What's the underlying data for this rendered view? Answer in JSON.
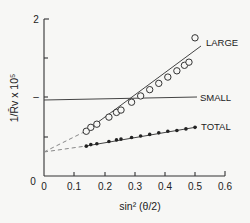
{
  "chart_data": {
    "type": "scatter",
    "title": "",
    "xlabel": "sin² (θ/2)",
    "ylabel": "1/R̄v x 10⁵",
    "xlim": [
      0,
      0.6
    ],
    "ylim": [
      0,
      2
    ],
    "x_ticks": [
      "0",
      "0.1",
      "0.2",
      "0.3",
      "0.4",
      "0.5",
      "0.6"
    ],
    "y_ticks": [
      "0",
      "1",
      "2"
    ],
    "grid": false,
    "series": [
      {
        "name": "LARGE",
        "marker": "open-circle",
        "x": [
          0.14,
          0.155,
          0.175,
          0.215,
          0.24,
          0.255,
          0.29,
          0.32,
          0.35,
          0.38,
          0.41,
          0.44,
          0.465,
          0.48,
          0.5
        ],
        "y": [
          0.57,
          0.62,
          0.66,
          0.75,
          0.81,
          0.84,
          0.94,
          1.02,
          1.1,
          1.18,
          1.26,
          1.34,
          1.41,
          1.45,
          1.76
        ],
        "fit": {
          "intercept": 0.3,
          "slope": 2.6,
          "extrapolated_dashed_to": 0
        }
      },
      {
        "name": "SMALL",
        "marker": "none",
        "x": [
          0,
          0.5
        ],
        "y": [
          0.96,
          0.96
        ]
      },
      {
        "name": "TOTAL",
        "marker": "filled-circle",
        "x": [
          0.14,
          0.155,
          0.175,
          0.215,
          0.24,
          0.255,
          0.29,
          0.32,
          0.35,
          0.38,
          0.41,
          0.44,
          0.47,
          0.5
        ],
        "y": [
          0.38,
          0.4,
          0.41,
          0.44,
          0.46,
          0.47,
          0.49,
          0.51,
          0.53,
          0.55,
          0.57,
          0.58,
          0.6,
          0.62
        ],
        "fit": {
          "intercept": 0.3,
          "slope": 0.64,
          "extrapolated_dashed_to": 0
        }
      }
    ],
    "annotations": [
      "LARGE",
      "SMALL",
      "TOTAL"
    ]
  },
  "labels": {
    "large": "LARGE",
    "small": "SMALL",
    "total": "TOTAL",
    "x0": "0",
    "x1": "0.1",
    "x2": "0.2",
    "x3": "0.3",
    "x4": "0.4",
    "x5": "0.5",
    "x6": "0.6",
    "y0": "0",
    "y1": "1",
    "y2": "2",
    "xlabel": "sin² (θ/2)",
    "ylabel": "1/R̄v x 10⁵"
  }
}
